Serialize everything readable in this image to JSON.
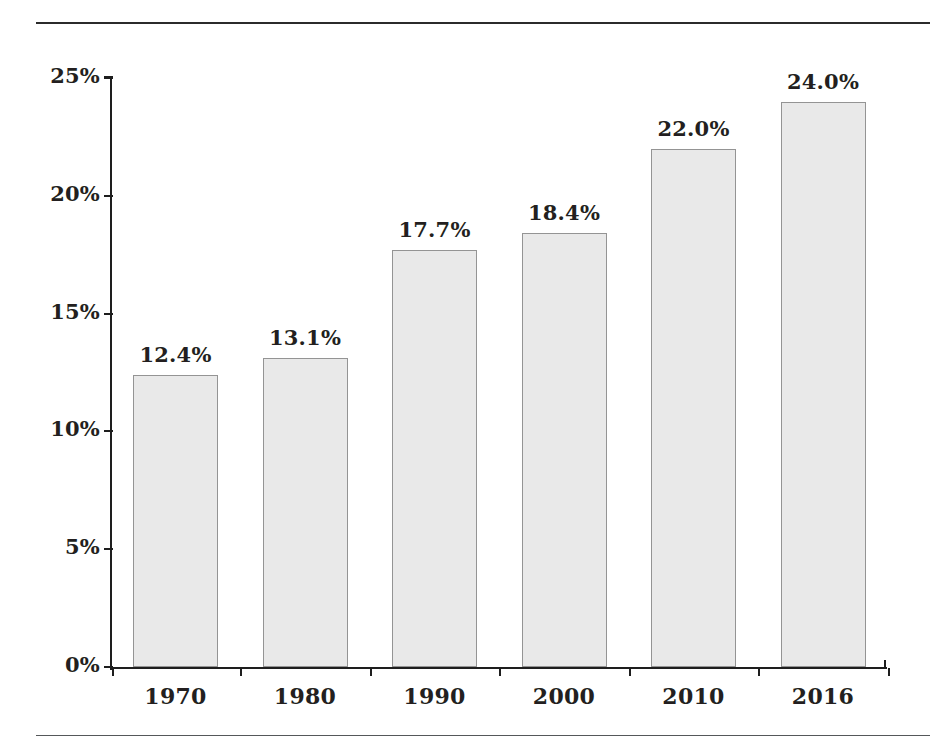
{
  "chart_data": {
    "type": "bar",
    "title": "",
    "subtitle": "",
    "xlabel": "",
    "ylabel": "",
    "categories": [
      "1970",
      "1980",
      "1990",
      "2000",
      "2010",
      "2016"
    ],
    "values": [
      12.4,
      13.1,
      17.7,
      18.4,
      22.0,
      24.0
    ],
    "value_labels": [
      "12.4%",
      "13.1%",
      "17.7%",
      "18.4%",
      "22.0%",
      "24.0%"
    ],
    "ylim": [
      0,
      25
    ],
    "ytick_values": [
      0,
      5,
      10,
      15,
      20,
      25
    ],
    "ytick_labels": [
      "0%",
      "5%",
      "10%",
      "15%",
      "20%",
      "25%"
    ],
    "grid": false,
    "legend": null,
    "bar_fill_color": "#e9e9e9",
    "bar_border_color": "#949494",
    "axis_color": "#1e1e1e",
    "text_color": "#231f20"
  },
  "decorations": {
    "top_rule": "",
    "bottom_rule": ""
  }
}
